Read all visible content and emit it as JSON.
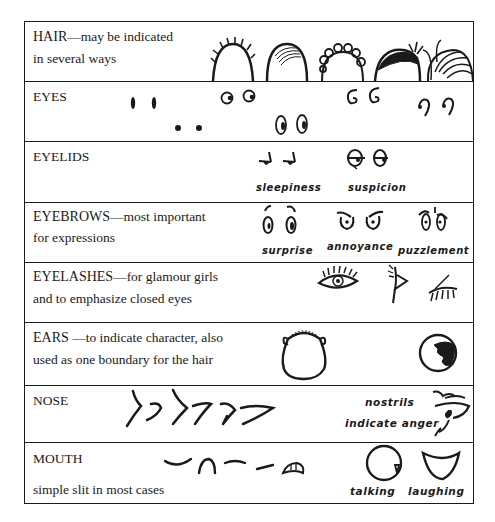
{
  "rows": [
    {
      "id": "hair",
      "title": "HAIR",
      "subtitle_line1": "—may be indicated",
      "subtitle_line2": "in several ways",
      "illustrations": [
        "spiky-hair",
        "shaded-hair",
        "curly-hair",
        "solid-hair-with-tuft",
        "swept-hair"
      ]
    },
    {
      "id": "eyes",
      "title": "EYES",
      "illustrations": [
        "dash-eyes",
        "dot-eyes",
        "round-eyes",
        "oval-eyes",
        "c-eyes",
        "curl-eyes"
      ]
    },
    {
      "id": "eyelids",
      "title": "EYELIDS",
      "captions": {
        "sleepiness": "sleepiness",
        "suspicion": "suspicion"
      }
    },
    {
      "id": "eyebrows",
      "title": "EYEBROWS",
      "subtitle_line1": "—most important",
      "subtitle_line2": "for expressions",
      "captions": {
        "surprise": "surprise",
        "annoyance": "annoyance",
        "puzzlement": "puzzlement"
      }
    },
    {
      "id": "eyelashes",
      "title": "EYELASHES",
      "subtitle_line1": "—for glamour girls",
      "subtitle_line2": "and to emphasize closed eyes",
      "illustrations": [
        "open-eye-lashes",
        "profile-eye-lashes",
        "closed-eye-lashes"
      ]
    },
    {
      "id": "ears",
      "title": "EARS",
      "subtitle_line1": " —to indicate character, also",
      "subtitle_line2": "used as one boundary for the hair",
      "illustrations": [
        "head-with-ears",
        "profile-head-with-ear"
      ]
    },
    {
      "id": "nose",
      "title": "NOSE",
      "captions": {
        "line1": "nostrils",
        "line2": "indicate anger"
      }
    },
    {
      "id": "mouth",
      "title": "MOUTH",
      "subtitle_line2": "simple slit in most cases",
      "captions": {
        "talking": "talking",
        "laughing": "laughing"
      }
    }
  ]
}
